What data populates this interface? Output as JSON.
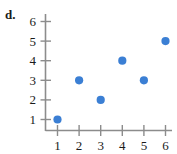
{
  "part_label": "d.",
  "colors": {
    "point": "#3b7fd4",
    "axis": "#8c8c8c",
    "text": "#1a1a1a",
    "background": "#ffffff"
  },
  "chart_data": {
    "type": "scatter",
    "title": "",
    "xlabel": "",
    "ylabel": "",
    "x": [
      1,
      2,
      3,
      4,
      5,
      6
    ],
    "values": [
      1,
      3,
      2,
      4,
      3,
      5
    ],
    "points": [
      {
        "x": 1,
        "y": 1
      },
      {
        "x": 2,
        "y": 3
      },
      {
        "x": 3,
        "y": 2
      },
      {
        "x": 4,
        "y": 4
      },
      {
        "x": 5,
        "y": 3
      },
      {
        "x": 6,
        "y": 5
      }
    ],
    "xticks": [
      1,
      2,
      3,
      4,
      5,
      6
    ],
    "yticks": [
      1,
      2,
      3,
      4,
      5,
      6
    ],
    "xtick_labels": [
      "1",
      "2",
      "3",
      "4",
      "5",
      "6"
    ],
    "ytick_labels": [
      "1",
      "2",
      "3",
      "4",
      "5",
      "6"
    ],
    "xlim": [
      0.45,
      6.45
    ],
    "ylim": [
      0.3,
      6.3
    ],
    "grid": false,
    "legend": null
  }
}
